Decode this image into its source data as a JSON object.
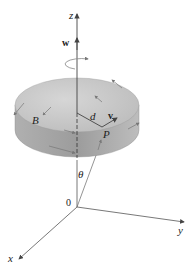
{
  "diagram": {
    "labels": {
      "z_axis": "z",
      "x_axis": "x",
      "y_axis": "y",
      "origin": "0",
      "angular_velocity": "w",
      "velocity": "v",
      "distance": "d",
      "point_p": "P",
      "point_b": "B",
      "angle": "θ"
    },
    "colors": {
      "disk_top": "#c8c8c8",
      "disk_side": "#a8a8a8",
      "axis": "#555555",
      "arrow": "#777777"
    }
  }
}
